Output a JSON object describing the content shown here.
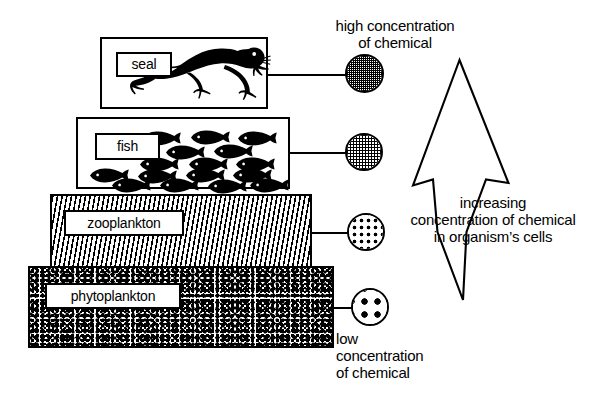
{
  "diagram": {
    "background_color": "#ffffff",
    "ink_color": "#000000"
  },
  "pyramid": {
    "tiers": [
      {
        "id": "seal",
        "label": "seal",
        "organism_icon": "seal-silhouette-icon",
        "fill": "white",
        "level": 4
      },
      {
        "id": "fish",
        "label": "fish",
        "organism_icon": "fish-school-silhouette-icon",
        "fill": "white",
        "level": 3
      },
      {
        "id": "zooplankton",
        "label": "zooplankton",
        "organism_icon": "zooplankton-dash-texture",
        "fill": "dash-texture",
        "level": 2
      },
      {
        "id": "phytoplankton",
        "label": "phytoplankton",
        "organism_icon": "phytoplankton-stipple-texture",
        "fill": "stipple-texture",
        "level": 1
      }
    ]
  },
  "concentration_markers": [
    {
      "id": "seal-marker",
      "tier": "seal",
      "fill_pattern": "dense-crosshatch",
      "relative_concentration": "highest"
    },
    {
      "id": "fish-marker",
      "tier": "fish",
      "fill_pattern": "medium-crosshatch",
      "relative_concentration": "high"
    },
    {
      "id": "zooplankton-marker",
      "tier": "zooplankton",
      "fill_pattern": "sparse-dots",
      "relative_concentration": "low"
    },
    {
      "id": "phytoplankton-marker",
      "tier": "phytoplankton",
      "fill_pattern": "very-sparse-dots",
      "relative_concentration": "lowest"
    }
  ],
  "annotations": {
    "high_concentration": {
      "lines": [
        "high  concentration",
        "of chemical"
      ]
    },
    "low_concentration": {
      "lines": [
        "low",
        "concentration",
        "of chemical"
      ]
    },
    "arrow_caption": {
      "lines": [
        "increasing",
        "concentration of chemical",
        "in organism’s cells"
      ]
    }
  },
  "arrow": {
    "name": "increasing-concentration-arrow",
    "direction": "up",
    "style": "outline"
  }
}
